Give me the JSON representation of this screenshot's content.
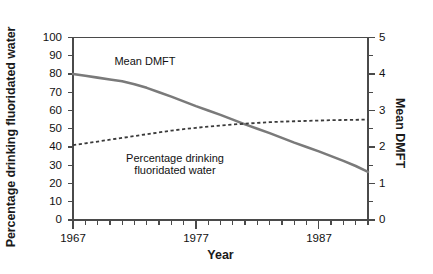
{
  "chart_data": {
    "type": "line",
    "title": "",
    "xlabel": "Year",
    "ylabel": "Percentage drinking fluoridated water",
    "ylabel_right": "Mean DMFT",
    "xlim": [
      1967,
      1991
    ],
    "ylim": [
      0,
      100
    ],
    "ylim_right": [
      0,
      5
    ],
    "grid": false,
    "legend": "inline annotations",
    "x_ticks_major": [
      "1967",
      "1977",
      "1987"
    ],
    "x_tick_values_major": [
      1967,
      1977,
      1987
    ],
    "x_tick_step_minor": 1,
    "y_ticks_left": [
      "0",
      "10",
      "20",
      "30",
      "40",
      "50",
      "60",
      "70",
      "80",
      "90",
      "100"
    ],
    "y_tick_values_left": [
      0,
      10,
      20,
      30,
      40,
      50,
      60,
      70,
      80,
      90,
      100
    ],
    "y_ticks_right": [
      "0",
      "1",
      "2",
      "3",
      "4",
      "5"
    ],
    "y_tick_values_right": [
      0,
      1,
      2,
      3,
      4,
      5
    ],
    "y_tick_step_minor_right": 0.5,
    "series": [
      {
        "name": "Mean DMFT",
        "axis": "right",
        "style": "solid",
        "color": "#7a7a7a",
        "width": 2.6,
        "annotation": "Mean DMFT",
        "x": [
          1967,
          1968,
          1969,
          1970,
          1971,
          1972,
          1973,
          1974,
          1975,
          1976,
          1977,
          1978,
          1979,
          1980,
          1981,
          1982,
          1983,
          1984,
          1985,
          1986,
          1987,
          1988,
          1989,
          1990,
          1991
        ],
        "values": [
          4.0,
          3.95,
          3.9,
          3.85,
          3.8,
          3.72,
          3.62,
          3.5,
          3.38,
          3.25,
          3.12,
          3.0,
          2.88,
          2.75,
          2.62,
          2.5,
          2.38,
          2.25,
          2.12,
          2.0,
          1.88,
          1.75,
          1.62,
          1.48,
          1.32
        ]
      },
      {
        "name": "Percentage drinking fluoridated water",
        "axis": "left",
        "style": "dotted",
        "color": "#3a3a3a",
        "width": 1.8,
        "annotation_line1": "Percentage drinking",
        "annotation_line2": "fluoridated water",
        "x": [
          1967,
          1968,
          1969,
          1970,
          1971,
          1972,
          1973,
          1974,
          1975,
          1976,
          1977,
          1978,
          1979,
          1980,
          1981,
          1982,
          1983,
          1984,
          1985,
          1986,
          1987,
          1988,
          1989,
          1990,
          1991
        ],
        "values": [
          41.0,
          42.0,
          43.0,
          44.0,
          45.0,
          46.0,
          47.0,
          48.0,
          49.0,
          49.8,
          50.5,
          51.2,
          51.8,
          52.3,
          52.8,
          53.2,
          53.6,
          53.9,
          54.1,
          54.3,
          54.5,
          54.7,
          54.8,
          54.9,
          55.0
        ]
      }
    ],
    "annotations": [
      {
        "text": "Mean DMFT",
        "x_px": 145,
        "y_px": 60
      },
      {
        "text": "Percentage drinking",
        "x_px": 175,
        "y_px": 157
      },
      {
        "text": "fluoridated water",
        "x_px": 175,
        "y_px": 169
      }
    ],
    "axis_color": "#4a4a4a"
  }
}
